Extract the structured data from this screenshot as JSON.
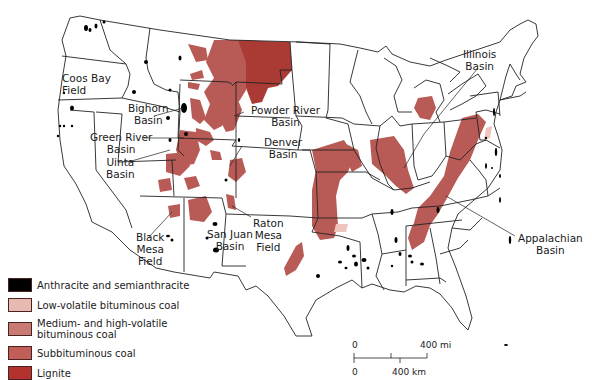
{
  "map": {
    "subject": "Coal fields of the conterminous United States",
    "labels": [
      {
        "id": "coos-bay",
        "text": "Coos Bay\nField"
      },
      {
        "id": "bighorn",
        "text": "Bighorn\nBasin"
      },
      {
        "id": "powder-river",
        "text": "Powder River\nBasin"
      },
      {
        "id": "green-river",
        "text": "Green River\nBasin"
      },
      {
        "id": "uinta",
        "text": "Uinta\nBasin"
      },
      {
        "id": "denver",
        "text": "Denver\nBasin"
      },
      {
        "id": "black-mesa",
        "text": "Black\nMesa\nField"
      },
      {
        "id": "san-juan",
        "text": "San Juan\nBasin"
      },
      {
        "id": "raton-mesa",
        "text": "Raton\nMesa\nField"
      },
      {
        "id": "illinois",
        "text": "Illinois\nBasin"
      },
      {
        "id": "appalachian",
        "text": "Appalachian\nBasin"
      }
    ]
  },
  "legend": {
    "items": [
      {
        "label": "Anthracite and semianthracite",
        "color": "#000000"
      },
      {
        "label": "Low-volatile bituminous coal",
        "color": "#e8b9b1"
      },
      {
        "label": "Medium- and high-volatile bituminous coal",
        "color": "#c97a72"
      },
      {
        "label": "Subbituminous coal",
        "color": "#c25e58"
      },
      {
        "label": "Lignite",
        "color": "#b2332e"
      }
    ]
  },
  "scale": {
    "zero_mi": "0",
    "mi": "400 mi",
    "zero_km": "0",
    "km": "400 km"
  },
  "colors": {
    "outline": "#222222",
    "coal_region": "#b85a55",
    "lignite_region": "#a93a34",
    "low_vol": "#efc4bd",
    "anthracite": "#000000"
  }
}
